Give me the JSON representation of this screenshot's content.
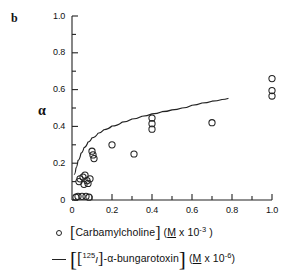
{
  "panel": {
    "label": "b"
  },
  "chart_data": {
    "type": "scatter",
    "title": "",
    "subtitle": "",
    "xlabel": "[Carbamylcholine] (M x 10-3)",
    "ylabel": "α",
    "xlim": [
      0,
      1.0
    ],
    "ylim": [
      0,
      1.0
    ],
    "grid": false,
    "legend_position": "below-axes",
    "x_ticks": [
      0,
      0.2,
      0.4,
      0.6,
      0.8,
      1.0
    ],
    "x_tick_labels": [
      "0",
      "0.2",
      "0.4",
      "0.6",
      "0.8",
      "1.0"
    ],
    "x_minor_ticks": [
      0.1,
      0.3,
      0.5,
      0.7,
      0.9
    ],
    "y_ticks": [
      0,
      0.2,
      0.4,
      0.6,
      0.8,
      1.0
    ],
    "y_tick_labels": [
      "0",
      "0.2",
      "0.4",
      "0.6",
      "0.8",
      "1.0"
    ],
    "y_minor_ticks": [
      0.1,
      0.3,
      0.5,
      0.7,
      0.9
    ],
    "series": [
      {
        "name": "[Carbamylcholine] (M x 10-3)",
        "type": "scatter",
        "marker": "open-circle",
        "color": "#222222",
        "points": [
          [
            0.02,
            0.015
          ],
          [
            0.03,
            0.02
          ],
          [
            0.035,
            0.1
          ],
          [
            0.04,
            0.115
          ],
          [
            0.05,
            0.02
          ],
          [
            0.055,
            0.125
          ],
          [
            0.06,
            0.085
          ],
          [
            0.065,
            0.135
          ],
          [
            0.07,
            0.02
          ],
          [
            0.075,
            0.105
          ],
          [
            0.08,
            0.09
          ],
          [
            0.085,
            0.015
          ],
          [
            0.09,
            0.115
          ],
          [
            0.1,
            0.265
          ],
          [
            0.105,
            0.245
          ],
          [
            0.11,
            0.225
          ],
          [
            0.2,
            0.3
          ],
          [
            0.31,
            0.25
          ],
          [
            0.4,
            0.445
          ],
          [
            0.4,
            0.415
          ],
          [
            0.4,
            0.385
          ],
          [
            0.7,
            0.42
          ],
          [
            1.0,
            0.66
          ],
          [
            1.0,
            0.595
          ],
          [
            1.0,
            0.565
          ]
        ]
      },
      {
        "name": "[[125I]-α-bungarotoxin] (M x 10-6)",
        "type": "line",
        "color": "#222222",
        "curve": [
          [
            0.012,
            0.14
          ],
          [
            0.02,
            0.175
          ],
          [
            0.03,
            0.215
          ],
          [
            0.045,
            0.255
          ],
          [
            0.06,
            0.285
          ],
          [
            0.08,
            0.315
          ],
          [
            0.1,
            0.338
          ],
          [
            0.13,
            0.363
          ],
          [
            0.16,
            0.382
          ],
          [
            0.2,
            0.402
          ],
          [
            0.25,
            0.423
          ],
          [
            0.3,
            0.44
          ],
          [
            0.35,
            0.455
          ],
          [
            0.4,
            0.468
          ],
          [
            0.45,
            0.48
          ],
          [
            0.5,
            0.49
          ],
          [
            0.55,
            0.5
          ],
          [
            0.6,
            0.515
          ],
          [
            0.65,
            0.527
          ],
          [
            0.7,
            0.537
          ],
          [
            0.75,
            0.546
          ],
          [
            0.78,
            0.552
          ]
        ]
      }
    ]
  },
  "axes": {
    "y_label_text": "α",
    "x_tick_labels": [
      "0",
      "0.2",
      "0.4",
      "0.6",
      "0.8",
      "1.0"
    ],
    "y_tick_labels": [
      "0",
      "0.2",
      "0.4",
      "0.6",
      "0.8",
      "1.0"
    ]
  },
  "legend": {
    "rows": [
      {
        "key": "open-circle",
        "text_plain": "[Carbamylcholine] ( M x 10-3 )",
        "label_main": "Carbamylcholine",
        "unit_prefix": "(",
        "unit_m": "M",
        "unit_times": " x 10",
        "unit_exp": "-3",
        "unit_suffix": " )"
      },
      {
        "key": "line",
        "text_plain": "[[125I]-α-bungarotoxin] ( M x 10-6 )",
        "iso_exp": "125",
        "iso_element": "I",
        "label_main": "-α-bungarotoxin",
        "unit_prefix": "(",
        "unit_m": "M",
        "unit_times": " x 10",
        "unit_exp": "-6",
        "unit_suffix": ")"
      }
    ]
  },
  "colors": {
    "ink": "#222222",
    "background": "#ffffff"
  }
}
